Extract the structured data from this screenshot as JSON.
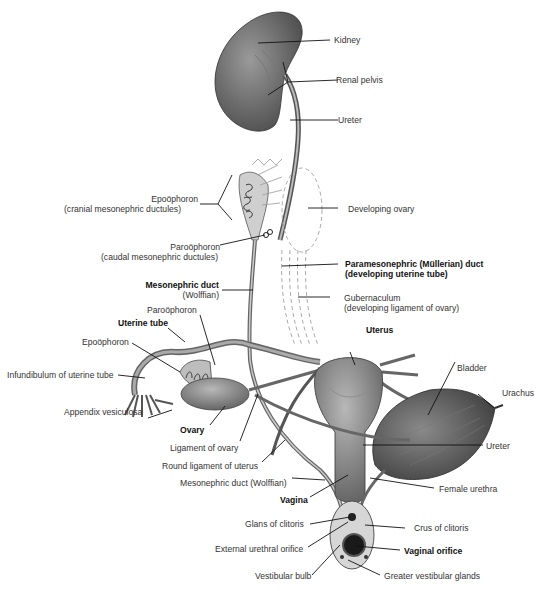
{
  "diagram": {
    "labels": {
      "kidney": "Kidney",
      "renal_pelvis": "Renal pelvis",
      "ureter_top": "Ureter",
      "epoophoron_cranial_1": "Epoöphoron",
      "epoophoron_cranial_2": "(cranial mesonephric ductules)",
      "developing_ovary": "Developing ovary",
      "paroophoron_caudal_1": "Paroöphoron",
      "paroophoron_caudal_2": "(caudal mesonephric ductules)",
      "paramesonephric_1": "Paramesonephric (Müllerian) duct",
      "paramesonephric_2": "(developing uterine tube)",
      "mesonephric_duct_1": "Mesonephric duct",
      "mesonephric_duct_2": "(Wolffian)",
      "gubernaculum_1": "Gubernaculum",
      "gubernaculum_2": "(developing ligament of ovary)",
      "paroophoron": "Paroöphoron",
      "uterine_tube": "Uterine tube",
      "uterus": "Uterus",
      "epoophoron": "Epoöphoron",
      "bladder": "Bladder",
      "urachus": "Urachus",
      "infundibulum": "Infundibulum of uterine tube",
      "appendix_vesiculosa": "Appendix vesiculosa",
      "ovary": "Ovary",
      "ligament_of_ovary": "Ligament of ovary",
      "ureter_bottom": "Ureter",
      "round_ligament": "Round ligament of uterus",
      "mesonephric_duct_wolffian": "Mesonephric duct (Wolffian)",
      "vagina": "Vagina",
      "female_urethra": "Female urethra",
      "glans_clitoris": "Glans of clitoris",
      "crus_clitoris": "Crus of clitoris",
      "external_urethral_orifice": "External urethral orifice",
      "vaginal_orifice": "Vaginal orifice",
      "vestibular_bulb": "Vestibular bulb",
      "greater_vestibular_glands": "Greater vestibular glands"
    }
  }
}
